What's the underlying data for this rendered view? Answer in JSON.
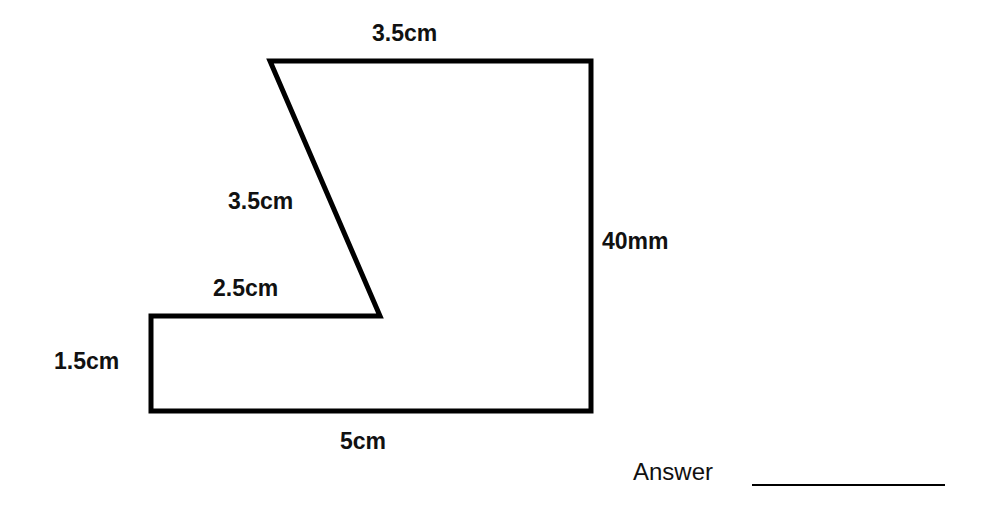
{
  "diagram": {
    "type": "compound-shape-perimeter",
    "stroke_color": "#000000",
    "background": "#ffffff",
    "vertices": [
      [
        270,
        61
      ],
      [
        591,
        61
      ],
      [
        591,
        411
      ],
      [
        151,
        411
      ],
      [
        151,
        316
      ],
      [
        380,
        316
      ]
    ],
    "labels": {
      "top": "3.5cm",
      "slant": "3.5cm",
      "right": "40mm",
      "inner_horizontal": "2.5cm",
      "left": "1.5cm",
      "bottom": "5cm"
    }
  },
  "answer": {
    "label": "Answer",
    "blank": "____________"
  }
}
